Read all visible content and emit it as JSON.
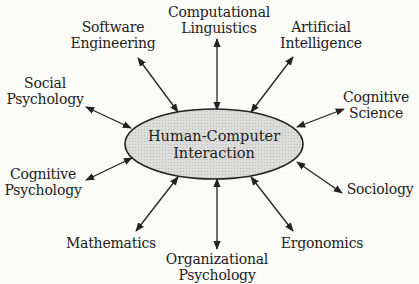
{
  "diagram": {
    "center": {
      "lines": [
        "Human-Computer",
        "Interaction"
      ],
      "fill": "#d6d6d4",
      "stroke": "#222222"
    },
    "nodes": [
      {
        "id": "software-engineering",
        "lines": [
          "Software",
          "Engineering"
        ]
      },
      {
        "id": "computational-linguistics",
        "lines": [
          "Computational",
          "Linguistics"
        ]
      },
      {
        "id": "artificial-intelligence",
        "lines": [
          "Artificial",
          "Intelligence"
        ]
      },
      {
        "id": "social-psychology",
        "lines": [
          "Social",
          "Psychology"
        ]
      },
      {
        "id": "cognitive-science",
        "lines": [
          "Cognitive",
          "Science"
        ]
      },
      {
        "id": "cognitive-psychology",
        "lines": [
          "Cognitive",
          "Psychology"
        ]
      },
      {
        "id": "sociology",
        "lines": [
          "Sociology"
        ]
      },
      {
        "id": "mathematics",
        "lines": [
          "Mathematics"
        ]
      },
      {
        "id": "organizational-psychology",
        "lines": [
          "Organizational",
          "Psychology"
        ]
      },
      {
        "id": "ergonomics",
        "lines": [
          "Ergonomics"
        ]
      }
    ],
    "edge_style": "bidirectional-arrow",
    "line_color": "#222222",
    "background": "#fbfbf8"
  }
}
